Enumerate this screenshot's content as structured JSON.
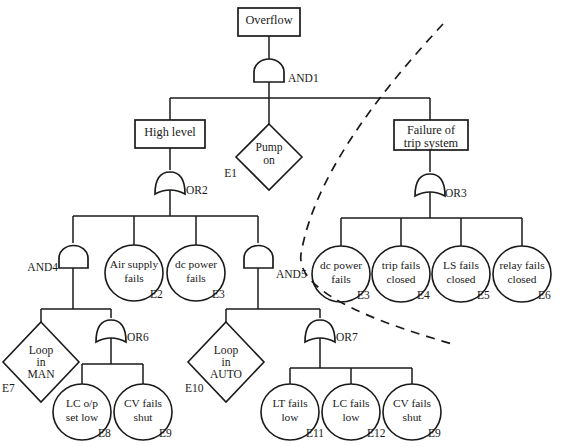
{
  "diagram": {
    "type": "fault-tree",
    "stroke_color": "#1a1a1a",
    "background_color": "#ffffff",
    "dashed_boundary_color": "#1a1a1a"
  },
  "top_event": {
    "label": "Overflow",
    "shape": "rectangle"
  },
  "gates": {
    "and1": "AND1",
    "or2": "OR2",
    "or3": "OR3",
    "and4": "AND4",
    "and5": "AND5",
    "or6": "OR6",
    "or7": "OR7"
  },
  "intermediate_events": {
    "high_level": "High level",
    "trip_failure_line1": "Failure of",
    "trip_failure_line2": "trip system"
  },
  "basic_events": {
    "pump_on": {
      "line1": "Pump",
      "line2": "on",
      "code": "E1",
      "shape": "diamond"
    },
    "air_supply_fails": {
      "line1": "Air supply",
      "line2": "fails",
      "code": "E2",
      "shape": "circle"
    },
    "dc_power_fails_left": {
      "line1": "dc power",
      "line2": "fails",
      "code": "E3",
      "shape": "circle"
    },
    "dc_power_fails_right": {
      "line1": "dc power",
      "line2": "fails",
      "code": "E3",
      "shape": "circle"
    },
    "trip_fails_closed": {
      "line1": "trip fails",
      "line2": "closed",
      "code": "E4",
      "shape": "circle"
    },
    "ls_fails_closed": {
      "line1": "LS fails",
      "line2": "closed",
      "code": "E5",
      "shape": "circle"
    },
    "relay_fails_closed": {
      "line1": "relay fails",
      "line2": "closed",
      "code": "E6",
      "shape": "circle"
    },
    "loop_in_man": {
      "line1": "Loop",
      "line2": "in",
      "line3": "MAN",
      "code": "E7",
      "shape": "diamond"
    },
    "lc_op_set_low": {
      "line1": "LC o/p",
      "line2": "set low",
      "code": "E8",
      "shape": "circle"
    },
    "cv_fails_shut_left": {
      "line1": "CV fails",
      "line2": "shut",
      "code": "E9",
      "shape": "circle"
    },
    "loop_in_auto": {
      "line1": "Loop",
      "line2": "in",
      "line3": "AUTO",
      "code": "E10",
      "shape": "diamond"
    },
    "lt_fails_low": {
      "line1": "LT fails",
      "line2": "low",
      "code": "E11",
      "shape": "circle"
    },
    "lc_fails_low": {
      "line1": "LC fails",
      "line2": "low",
      "code": "E12",
      "shape": "circle"
    },
    "cv_fails_shut_right": {
      "line1": "CV fails",
      "line2": "shut",
      "code": "E9",
      "shape": "circle"
    }
  }
}
